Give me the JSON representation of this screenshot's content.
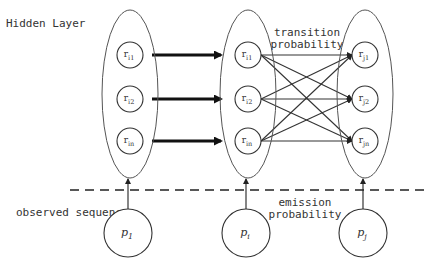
{
  "labels": {
    "hidden_layer": "Hidden Layer",
    "transition": [
      "transition",
      "probability"
    ],
    "emission": [
      "emission",
      "probability"
    ],
    "observed_sequence": "observed sequence"
  },
  "hidden_columns": [
    {
      "nodes": [
        {
          "base": "r",
          "sub": "i1"
        },
        {
          "base": "r",
          "sub": "i2"
        },
        {
          "base": "r",
          "sub": "in"
        }
      ]
    },
    {
      "nodes": [
        {
          "base": "r",
          "sub": "i1"
        },
        {
          "base": "r",
          "sub": "i2"
        },
        {
          "base": "r",
          "sub": "in"
        }
      ]
    },
    {
      "nodes": [
        {
          "base": "r",
          "sub": "j1"
        },
        {
          "base": "r",
          "sub": "j2"
        },
        {
          "base": "r",
          "sub": "jn"
        }
      ]
    }
  ],
  "observed": [
    {
      "base": "p",
      "sub": "1"
    },
    {
      "base": "p",
      "sub": "i"
    },
    {
      "base": "p",
      "sub": "j"
    }
  ],
  "colors": {
    "stroke": "#333333",
    "thin_stroke": "#555555",
    "background": "#ffffff"
  }
}
